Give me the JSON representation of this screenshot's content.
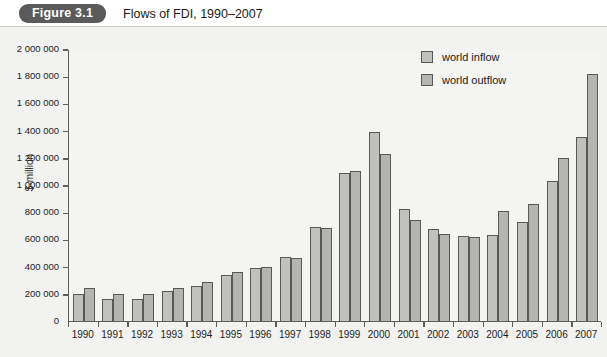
{
  "header": {
    "badge": "Figure 3.1",
    "title": "Flows of FDI, 1990–2007"
  },
  "chart_data": {
    "type": "bar",
    "title": "Flows of FDI, 1990–2007",
    "xlabel": "",
    "ylabel": "$-million",
    "ylim": [
      0,
      2000000
    ],
    "ytick_step": 200000,
    "yticks": [
      0,
      200000,
      400000,
      600000,
      800000,
      1000000,
      1200000,
      1400000,
      1600000,
      1800000,
      2000000
    ],
    "ytick_labels": [
      "0",
      "200 000",
      "400 000",
      "600 000",
      "800 000",
      "1 000 000",
      "1 200 000",
      "1 400 000",
      "1 600 000",
      "1 800 000",
      "2 000 000"
    ],
    "grid": false,
    "legend_position": "upper right",
    "categories": [
      "1990",
      "1991",
      "1992",
      "1993",
      "1994",
      "1995",
      "1996",
      "1997",
      "1998",
      "1999",
      "2000",
      "2001",
      "2002",
      "2003",
      "2004",
      "2005",
      "2006",
      "2007"
    ],
    "series": [
      {
        "name": "world inflow",
        "color": "#c0c0bd",
        "values": [
          200000,
          160000,
          165000,
          220000,
          255000,
          340000,
          390000,
          470000,
          690000,
          1090000,
          1390000,
          820000,
          680000,
          625000,
          635000,
          730000,
          1030000,
          1350000
        ]
      },
      {
        "name": "world outflow",
        "color": "#b4b4b1",
        "values": [
          240000,
          200000,
          200000,
          240000,
          285000,
          360000,
          395000,
          465000,
          685000,
          1100000,
          1230000,
          740000,
          640000,
          615000,
          810000,
          860000,
          1200000,
          1815000
        ]
      }
    ]
  },
  "legend": {
    "items": [
      {
        "label": "world inflow",
        "key": "inflow"
      },
      {
        "label": "world outflow",
        "key": "outflow"
      }
    ]
  }
}
